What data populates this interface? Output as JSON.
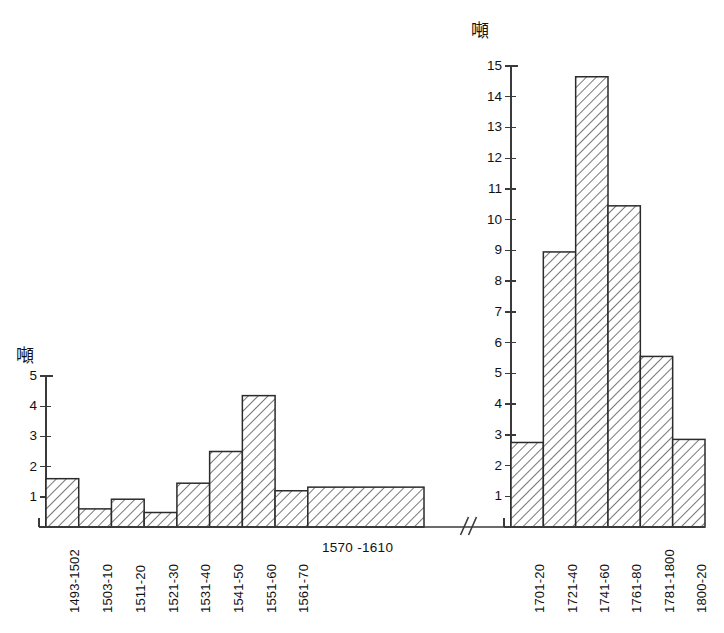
{
  "figure": {
    "background_color": "#ffffff",
    "ink_color": "#2b2b2b",
    "bar_fill": "hatch-diagonal-45",
    "axis_break_symbol": "//"
  },
  "chart_data": [
    {
      "type": "bar",
      "id": "left-panel",
      "title": "",
      "xlabel": "",
      "ylabel": "噸",
      "ylim": [
        0,
        5
      ],
      "yticks": [
        1,
        2,
        3,
        4,
        5
      ],
      "ytick_labels": [
        "1",
        "2",
        "3",
        "4",
        "5"
      ],
      "grid": false,
      "legend": "none",
      "categories": [
        "1493-1502",
        "1503-10",
        "1511-20",
        "1521-30",
        "1531-40",
        "1541-50",
        "1551-60",
        "1561-70",
        "1570 -1610"
      ],
      "values": [
        1.6,
        0.6,
        0.92,
        0.48,
        1.45,
        2.5,
        4.35,
        1.2,
        1.32
      ],
      "bar_widths": [
        1,
        1,
        1,
        1,
        1,
        1,
        1,
        1,
        3.55
      ],
      "label_orientation": [
        "vertical",
        "vertical",
        "vertical",
        "vertical",
        "vertical",
        "vertical",
        "vertical",
        "vertical",
        "horizontal"
      ]
    },
    {
      "type": "bar",
      "id": "right-panel",
      "title": "",
      "xlabel": "",
      "ylabel": "噸",
      "ylim": [
        0,
        15
      ],
      "yticks": [
        1,
        2,
        3,
        4,
        5,
        6,
        7,
        8,
        9,
        10,
        11,
        12,
        13,
        14,
        15
      ],
      "ytick_labels": [
        "1",
        "2",
        "3",
        "4",
        "5",
        "6",
        "7",
        "8",
        "9",
        "10",
        "11",
        "12",
        "13",
        "14",
        "15"
      ],
      "grid": false,
      "legend": "none",
      "categories": [
        "1701-20",
        "1721-40",
        "1741-60",
        "1761-80",
        "1781-1800",
        "1800-20"
      ],
      "values": [
        2.75,
        8.95,
        14.65,
        10.45,
        5.55,
        2.85
      ],
      "bar_widths": [
        1,
        1,
        1,
        1,
        1,
        1
      ],
      "label_orientation": [
        "vertical",
        "vertical",
        "vertical",
        "vertical",
        "vertical",
        "vertical"
      ]
    }
  ]
}
